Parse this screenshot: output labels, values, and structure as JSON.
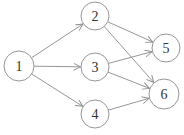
{
  "diagram": {
    "type": "directed-graph",
    "colors": {
      "stroke": "#8a8a8a",
      "text": "#333333",
      "background": "#ffffff"
    },
    "nodes": [
      {
        "id": "1",
        "label": "1",
        "x": 19,
        "y": 66,
        "r": 15
      },
      {
        "id": "2",
        "label": "2",
        "x": 95,
        "y": 16,
        "r": 14
      },
      {
        "id": "3",
        "label": "3",
        "x": 95,
        "y": 67,
        "r": 14
      },
      {
        "id": "4",
        "label": "4",
        "x": 95,
        "y": 114,
        "r": 14
      },
      {
        "id": "5",
        "label": "5",
        "x": 166,
        "y": 48,
        "r": 14
      },
      {
        "id": "6",
        "label": "6",
        "x": 164,
        "y": 94,
        "r": 15
      }
    ],
    "edges": [
      {
        "from": "1",
        "to": "2"
      },
      {
        "from": "1",
        "to": "3"
      },
      {
        "from": "1",
        "to": "4"
      },
      {
        "from": "2",
        "to": "5"
      },
      {
        "from": "2",
        "to": "6"
      },
      {
        "from": "3",
        "to": "5"
      },
      {
        "from": "3",
        "to": "6"
      },
      {
        "from": "4",
        "to": "6"
      }
    ]
  }
}
